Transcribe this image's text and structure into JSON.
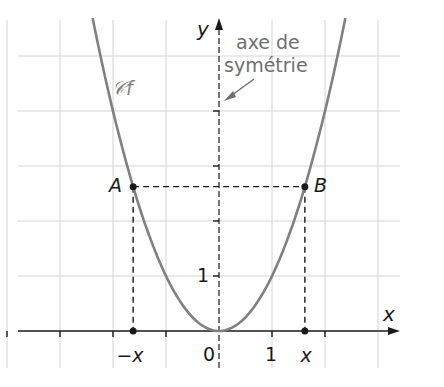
{
  "figure": {
    "function_expression": "f(x) = x^2",
    "curve_label": "𝒞f",
    "axis_x_label": "x",
    "axis_y_label": "y",
    "origin_label": "0",
    "x_tick_label": "1",
    "y_tick_label": "1",
    "point_A_label": "A",
    "point_B_label": "B",
    "minus_x_label": "−x",
    "plus_x_label": "x",
    "annotation_line1": "axe de",
    "annotation_line2": "symétrie",
    "x_range": [
      -4,
      3
    ],
    "y_range": [
      0,
      5
    ],
    "point_x_value": 1.62,
    "colors": {
      "curve": "#808080",
      "grid": "#d4d4d4",
      "axes": "#1a1a1a",
      "annotation": "#6f6f6f"
    }
  }
}
